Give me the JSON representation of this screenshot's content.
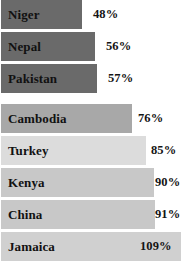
{
  "chart_data": {
    "type": "bar",
    "orientation": "horizontal",
    "title": "",
    "subtitle": "",
    "xlabel": "",
    "ylabel": "",
    "grid": false,
    "legend": null,
    "axis_visible": false,
    "xlim": [
      0,
      109
    ],
    "categories": [
      "Niger",
      "Nepal",
      "Pakistan",
      "Cambodia",
      "Turkey",
      "Kenya",
      "China",
      "Jamaica"
    ],
    "values": [
      48,
      56,
      57,
      76,
      85,
      90,
      91,
      109
    ],
    "value_labels": [
      "48%",
      "56%",
      "57%",
      "76%",
      "85%",
      "90%",
      "91%",
      "109%"
    ],
    "value_unit": "%",
    "bar_colors": [
      "#6a6a6a",
      "#6a6a6a",
      "#6a6a6a",
      "#a8a8a8",
      "#dcdcdc",
      "#c8c8c8",
      "#c8c8c8",
      "#d0d0d0"
    ],
    "background": "#ffffff",
    "label_color": "#111111",
    "value_color": "#141414"
  },
  "rows": [
    {
      "label": "Niger",
      "value_label": "48%",
      "bar_width_px": 81,
      "value_left_px": 93,
      "color": "#6a6a6a",
      "top_px": 0,
      "value_inside": false
    },
    {
      "label": "Nepal",
      "value_label": "56%",
      "bar_width_px": 94,
      "value_left_px": 106,
      "color": "#6a6a6a",
      "top_px": 32,
      "value_inside": false
    },
    {
      "label": "Pakistan",
      "value_label": "57%",
      "bar_width_px": 96,
      "value_left_px": 108,
      "color": "#6a6a6a",
      "top_px": 64,
      "value_inside": false
    },
    {
      "label": "Cambodia",
      "value_label": "76%",
      "bar_width_px": 131,
      "value_left_px": 138,
      "color": "#a8a8a8",
      "top_px": 104,
      "value_inside": false
    },
    {
      "label": "Turkey",
      "value_label": "85%",
      "bar_width_px": 145,
      "value_left_px": 151,
      "color": "#dcdcdc",
      "top_px": 136,
      "value_inside": false
    },
    {
      "label": "Kenya",
      "value_label": "90%",
      "bar_width_px": 153,
      "value_left_px": 155,
      "color": "#c8c8c8",
      "top_px": 168,
      "value_inside": false
    },
    {
      "label": "China",
      "value_label": "91%",
      "bar_width_px": 154,
      "value_left_px": 155,
      "color": "#c8c8c8",
      "top_px": 200,
      "value_inside": false
    },
    {
      "label": "Jamaica",
      "value_label": "109%",
      "bar_width_px": 180,
      "value_left_px": 140,
      "color": "#d0d0d0",
      "top_px": 232,
      "value_inside": true
    }
  ]
}
